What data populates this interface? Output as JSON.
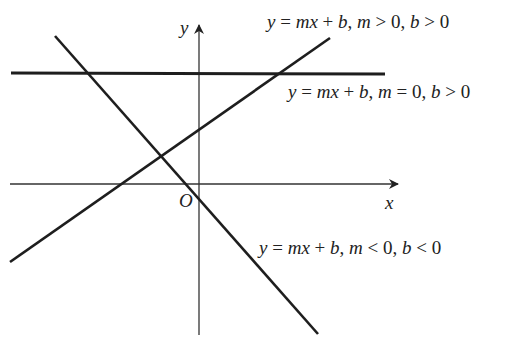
{
  "diagram": {
    "type": "coordinate-plane-lines",
    "colors": {
      "line": "#1e1e1e",
      "axis": "#333333",
      "text": "#222222",
      "background": "#ffffff"
    },
    "axes": {
      "x_label": "x",
      "y_label": "y",
      "origin_label": "O",
      "x_axis": {
        "x1": 10,
        "y1": 184,
        "x2": 398,
        "y2": 184
      },
      "y_axis": {
        "x1": 199,
        "y1": 335,
        "x2": 199,
        "y2": 25
      }
    },
    "lines": [
      {
        "id": "positive-slope",
        "label": "y = mx + b, m > 0, b > 0",
        "label_parts": [
          "y",
          " = ",
          "mx",
          " + ",
          "b",
          ", ",
          "m",
          " > 0, ",
          "b",
          " > 0"
        ],
        "x1": 10,
        "y1": 262,
        "x2": 330,
        "y2": 38
      },
      {
        "id": "zero-slope",
        "label": "y = mx + b, m = 0, b > 0",
        "label_parts": [
          "y",
          " = ",
          "mx",
          " + ",
          "b",
          ", ",
          "m",
          " = 0, ",
          "b",
          " > 0"
        ],
        "x1": 11,
        "y1": 73,
        "x2": 385,
        "y2": 74
      },
      {
        "id": "negative-slope",
        "label": "y = mx + b, m < 0, b < 0",
        "label_parts": [
          "y",
          " = ",
          "mx",
          " + ",
          "b",
          ", ",
          "m",
          " < 0, ",
          "b",
          " < 0"
        ],
        "x1": 55,
        "y1": 36,
        "x2": 318,
        "y2": 334
      }
    ]
  }
}
